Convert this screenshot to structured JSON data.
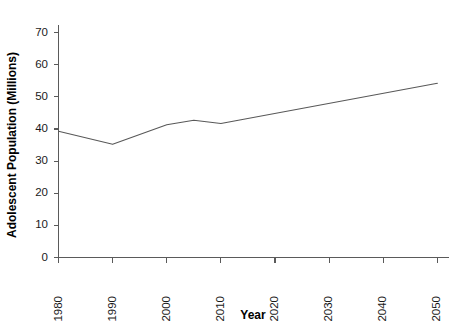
{
  "chart_data": {
    "type": "line",
    "title": "",
    "xlabel": "Year",
    "ylabel": "Adolescent Population (Millions)",
    "xlim": [
      1980,
      2050
    ],
    "ylim": [
      0,
      75
    ],
    "grid": false,
    "legend": false,
    "line_color": "#585858",
    "axis_color": "#5a5a5a",
    "x": [
      1980,
      1990,
      2000,
      2005,
      2010,
      2050
    ],
    "values": [
      39.3,
      35.2,
      41.3,
      42.7,
      41.7,
      54.2
    ],
    "series": [
      {
        "name": "Adolescent Population",
        "x": [
          1980,
          1990,
          2000,
          2005,
          2010,
          2050
        ],
        "values": [
          39.3,
          35.2,
          41.3,
          42.7,
          41.7,
          54.2
        ]
      }
    ],
    "xticks": [
      1980,
      1990,
      2000,
      2010,
      2020,
      2030,
      2040,
      2050
    ],
    "xticklabels": [
      "1980",
      "1990",
      "2000",
      "2010",
      "2020",
      "2030",
      "2040",
      "2050"
    ],
    "yticks": [
      0,
      10,
      20,
      30,
      40,
      50,
      60,
      70
    ],
    "yticklabels": [
      "0",
      "10",
      "20",
      "30",
      "40",
      "50",
      "60",
      "70"
    ]
  }
}
